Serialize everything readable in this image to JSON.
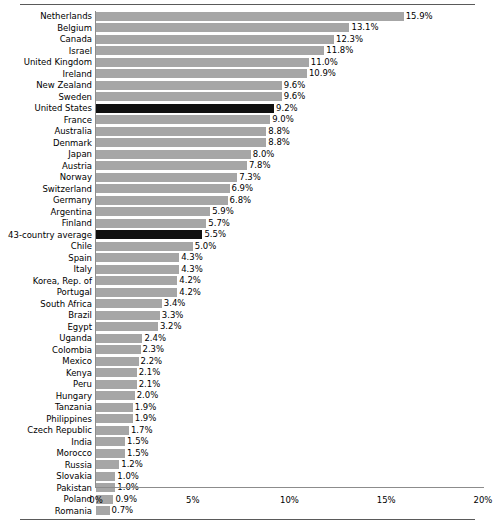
{
  "chart_data": {
    "type": "bar",
    "orientation": "horizontal",
    "title": "",
    "subtitle": "",
    "xlabel": "",
    "ylabel": "",
    "xlim": [
      0,
      20
    ],
    "grid": false,
    "legend": null,
    "x_tick_labels": [
      "0%",
      "5%",
      "10%",
      "15%",
      "20%"
    ],
    "x_tick_values": [
      0,
      5,
      10,
      15,
      20
    ],
    "value_format": "percent_one_decimal",
    "highlight_color": "#101010",
    "bar_color": "#a6a6a6",
    "highlighted_categories": [
      "United States",
      "43-country average"
    ],
    "categories": [
      "Netherlands",
      "Belgium",
      "Canada",
      "Israel",
      "United Kingdom",
      "Ireland",
      "New Zealand",
      "Sweden",
      "United States",
      "France",
      "Australia",
      "Denmark",
      "Japan",
      "Austria",
      "Norway",
      "Switzerland",
      "Germany",
      "Argentina",
      "Finland",
      "43-country average",
      "Chile",
      "Spain",
      "Italy",
      "Korea, Rep. of",
      "Portugal",
      "South Africa",
      "Brazil",
      "Egypt",
      "Uganda",
      "Colombia",
      "Mexico",
      "Kenya",
      "Peru",
      "Hungary",
      "Tanzania",
      "Philippines",
      "Czech Republic",
      "India",
      "Morocco",
      "Russia",
      "Slovakia",
      "Pakistan",
      "Poland",
      "Romania"
    ],
    "values": [
      15.9,
      13.1,
      12.3,
      11.8,
      11.0,
      10.9,
      9.6,
      9.6,
      9.2,
      9.0,
      8.8,
      8.8,
      8.0,
      7.8,
      7.3,
      6.9,
      6.8,
      5.9,
      5.7,
      5.5,
      5.0,
      4.3,
      4.3,
      4.2,
      4.2,
      3.4,
      3.3,
      3.2,
      2.4,
      2.3,
      2.2,
      2.1,
      2.1,
      2.0,
      1.9,
      1.9,
      1.7,
      1.5,
      1.5,
      1.2,
      1.0,
      1.0,
      0.9,
      0.7
    ],
    "value_labels": [
      "15.9%",
      "13.1%",
      "12.3%",
      "11.8%",
      "11.0%",
      "10.9%",
      "9.6%",
      "9.6%",
      "9.2%",
      "9.0%",
      "8.8%",
      "8.8%",
      "8.0%",
      "7.8%",
      "7.3%",
      "6.9%",
      "6.8%",
      "5.9%",
      "5.7%",
      "5.5%",
      "5.0%",
      "4.3%",
      "4.3%",
      "4.2%",
      "4.2%",
      "3.4%",
      "3.3%",
      "3.2%",
      "2.4%",
      "2.3%",
      "2.2%",
      "2.1%",
      "2.1%",
      "2.0%",
      "1.9%",
      "1.9%",
      "1.7%",
      "1.5%",
      "1.5%",
      "1.2%",
      "1.0%",
      "1.0%",
      "0.9%",
      "0.7%"
    ]
  }
}
